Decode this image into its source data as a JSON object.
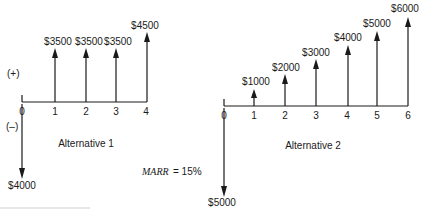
{
  "diagram": {
    "type": "cash-flow-diagram",
    "sign_labels": {
      "positive": "(+)",
      "negative": "(–)"
    },
    "marr": {
      "label": "MARR",
      "value": "= 15%"
    },
    "alternatives": [
      {
        "caption": "Alternative 1",
        "periods": [
          "0",
          "1",
          "2",
          "3",
          "4"
        ],
        "cash_flows": [
          {
            "period": 0,
            "amount": -4000,
            "label": "$4000"
          },
          {
            "period": 1,
            "amount": 3500,
            "label": "$3500"
          },
          {
            "period": 2,
            "amount": 3500,
            "label": "$3500"
          },
          {
            "period": 3,
            "amount": 3500,
            "label": "$3500"
          },
          {
            "period": 4,
            "amount": 4500,
            "label": "$4500"
          }
        ]
      },
      {
        "caption": "Alternative 2",
        "periods": [
          "0",
          "1",
          "2",
          "3",
          "4",
          "5",
          "6"
        ],
        "cash_flows": [
          {
            "period": 0,
            "amount": -5000,
            "label": "$5000"
          },
          {
            "period": 1,
            "amount": 1000,
            "label": "$1000"
          },
          {
            "period": 2,
            "amount": 2000,
            "label": "$2000"
          },
          {
            "period": 3,
            "amount": 3000,
            "label": "$3000"
          },
          {
            "period": 4,
            "amount": 4000,
            "label": "$4000"
          },
          {
            "period": 5,
            "amount": 5000,
            "label": "$5000"
          },
          {
            "period": 6,
            "amount": 6000,
            "label": "$6000"
          }
        ]
      }
    ]
  }
}
